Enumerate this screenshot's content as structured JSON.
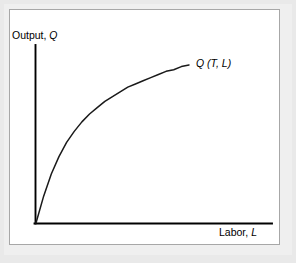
{
  "figure": {
    "background_color": "#e9e9e9",
    "panel_color": "#ffffff",
    "panel_border_color": "#a7a7a7",
    "ink_color": "#000000"
  },
  "labels": {
    "y_axis_prefix": "Output, ",
    "y_axis_symbol": "Q",
    "x_axis_prefix": "Labor, ",
    "x_axis_symbol": "L",
    "curve_prefix": "Q",
    "curve_args": " (T, L)"
  },
  "chart_data": {
    "type": "line",
    "title": "",
    "subtitle": "",
    "xlabel": "Labor, L",
    "ylabel": "Output, Q",
    "legend": [],
    "legend_position": "none",
    "grid": false,
    "axis_ticks": [],
    "xlim": [
      0,
      1
    ],
    "ylim": [
      0,
      1
    ],
    "annotations": [
      {
        "text": "Q (T, L)",
        "x": 0.66,
        "y": 0.99,
        "description": "curve label for the production function"
      }
    ],
    "series": [
      {
        "name": "Q (T, L)",
        "description": "concave increasing production function through the origin, diminishing marginal returns to labor",
        "color": "#1a1a1a",
        "x": [
          0.0,
          0.05,
          0.1,
          0.15,
          0.2,
          0.25,
          0.3,
          0.35,
          0.4,
          0.45,
          0.5,
          0.55,
          0.6,
          0.65,
          0.7,
          0.75,
          0.8,
          0.85,
          0.9,
          0.95,
          1.0
        ],
        "y": [
          0.0,
          0.17,
          0.31,
          0.42,
          0.51,
          0.58,
          0.64,
          0.69,
          0.73,
          0.77,
          0.8,
          0.83,
          0.86,
          0.88,
          0.9,
          0.92,
          0.94,
          0.96,
          0.97,
          0.99,
          1.0
        ]
      }
    ]
  }
}
